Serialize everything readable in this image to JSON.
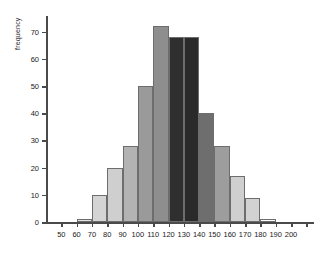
{
  "chart_data": {
    "type": "bar",
    "title": "",
    "xlabel": "",
    "ylabel": "frequency",
    "xlim": [
      40,
      215
    ],
    "ylim": [
      0,
      75
    ],
    "grid": false,
    "legend": null,
    "bin_width": 10,
    "categories": [
      "50-60",
      "60-70",
      "70-80",
      "80-90",
      "90-100",
      "100-110",
      "110-120",
      "120-130",
      "130-140",
      "140-150",
      "150-160",
      "160-170",
      "170-180",
      "180-190",
      "190-200"
    ],
    "bin_starts": [
      50,
      60,
      70,
      80,
      90,
      100,
      110,
      120,
      130,
      140,
      150,
      160,
      170,
      180,
      190
    ],
    "values": [
      0,
      1,
      10,
      20,
      28,
      50,
      72,
      68,
      68,
      40,
      28,
      17,
      9,
      1,
      0
    ],
    "bar_colors": [
      "#ffffff",
      "#e2e2e2",
      "#d4d4d4",
      "#cfcfcf",
      "#b3b3b3",
      "#9a9a9a",
      "#8e8e8e",
      "#2f2f2f",
      "#2a2a2a",
      "#6e6e6e",
      "#9d9d9d",
      "#cfcfcf",
      "#d2d2d2",
      "#ffffff",
      "#ffffff"
    ],
    "xticks": [
      50,
      60,
      70,
      80,
      90,
      100,
      110,
      120,
      130,
      140,
      150,
      160,
      170,
      180,
      190,
      200
    ],
    "xtick_labels": [
      "50",
      "60",
      "70",
      "80",
      "90",
      "100",
      "110",
      "120",
      "130",
      "140",
      "150",
      "160",
      "170",
      "180",
      "190",
      "200"
    ],
    "yticks": [
      0,
      10,
      20,
      30,
      40,
      50,
      60,
      70
    ],
    "ytick_labels": [
      "0",
      "10",
      "20",
      "30",
      "40",
      "50",
      "60",
      "70"
    ],
    "extra_xticks": [
      210
    ],
    "axis_color": "#4a4a4a",
    "bar_edge_color": "#6d6d6d",
    "background": "#ffffff"
  }
}
